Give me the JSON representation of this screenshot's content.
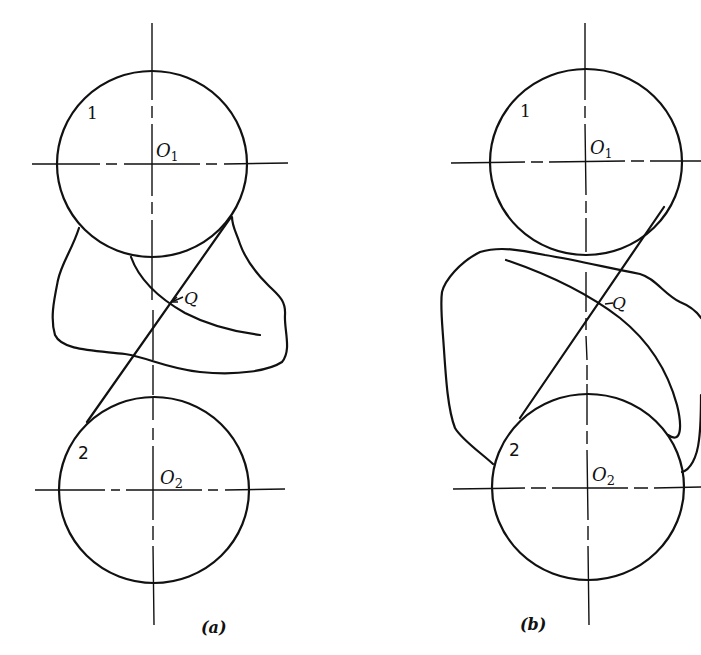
{
  "figure": {
    "panels": [
      {
        "id": "a",
        "caption": "(a)",
        "labels": {
          "circle1_number": "1",
          "circle2_number": "2",
          "center1": "O",
          "center1_sub": "1",
          "center2": "O",
          "center2_sub": "2",
          "point": "Q"
        }
      },
      {
        "id": "b",
        "caption": "(b)",
        "labels": {
          "circle1_number": "1",
          "circle2_number": "2",
          "center1": "O",
          "center1_sub": "1",
          "center2": "O",
          "center2_sub": "2",
          "point": "Q"
        }
      }
    ],
    "colors": {
      "ink": "#111111",
      "background": "#ffffff"
    }
  }
}
